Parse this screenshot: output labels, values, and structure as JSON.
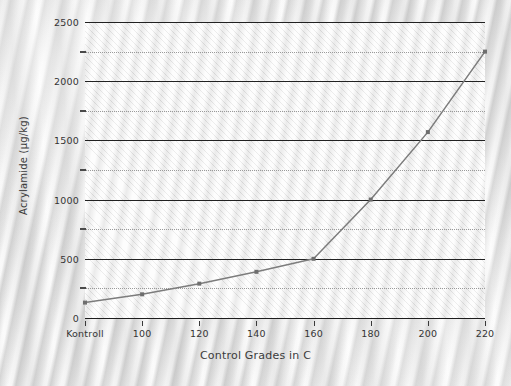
{
  "chart_data": {
    "type": "line",
    "title": "",
    "xlabel": "Control Grades in C",
    "ylabel": "Acrylamide (µg/kg)",
    "categories": [
      "Kontroll",
      "100",
      "120",
      "140",
      "160",
      "180",
      "200",
      "220"
    ],
    "values": [
      130,
      200,
      290,
      390,
      500,
      1000,
      1570,
      2250
    ],
    "series": [
      {
        "name": "Acrylamide",
        "values": [
          130,
          200,
          290,
          390,
          500,
          1000,
          1570,
          2250
        ]
      }
    ],
    "ylim": [
      0,
      2500
    ],
    "ytick_labels": [
      "0",
      "500",
      "1000",
      "1500",
      "2000",
      "2500"
    ],
    "ytick_values": [
      0,
      500,
      1000,
      1500,
      2000,
      2500
    ],
    "yminor_values": [
      250,
      750,
      1250,
      1750,
      2250
    ],
    "xtick_labels": [
      "Kontroll",
      "100",
      "120",
      "140",
      "160",
      "180",
      "200",
      "220"
    ],
    "grid": true,
    "grid_major_color": "#222222",
    "grid_minor_color": "#9a9a9a",
    "legend": "none",
    "line_color": "#7c7c7c",
    "marker_color": "#6e6e6e",
    "marker": "square",
    "plot_background": "#fbfbfb",
    "page_background": "#e9e9e9"
  }
}
